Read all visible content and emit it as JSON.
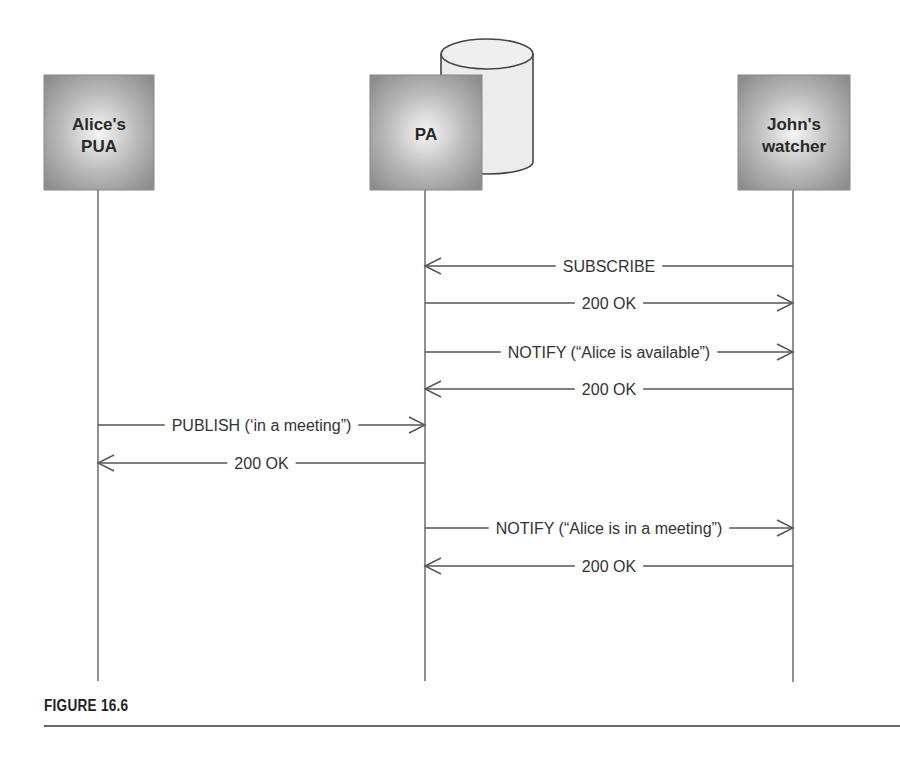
{
  "figure": {
    "caption": "FIGURE 16.6"
  },
  "actors": [
    {
      "id": "alice",
      "lines": [
        "Alice's",
        "PUA"
      ]
    },
    {
      "id": "pa",
      "lines": [
        "PA"
      ],
      "has_database": true
    },
    {
      "id": "john",
      "lines": [
        "John's",
        "watcher"
      ]
    }
  ],
  "messages": [
    {
      "from": "john",
      "to": "pa",
      "label": "SUBSCRIBE"
    },
    {
      "from": "pa",
      "to": "john",
      "label": "200 OK"
    },
    {
      "from": "pa",
      "to": "john",
      "label": "NOTIFY (“Alice is available”)"
    },
    {
      "from": "john",
      "to": "pa",
      "label": "200 OK"
    },
    {
      "from": "alice",
      "to": "pa",
      "label": "PUBLISH (‘in a meeting”)"
    },
    {
      "from": "pa",
      "to": "alice",
      "label": "200 OK"
    },
    {
      "from": "pa",
      "to": "john",
      "label": "NOTIFY (“Alice is in a meeting”)"
    },
    {
      "from": "john",
      "to": "pa",
      "label": "200 OK"
    }
  ],
  "colors": {
    "box_edge": "#8c8c8c",
    "box_center": "#f4f4f4",
    "line": "#555555"
  }
}
